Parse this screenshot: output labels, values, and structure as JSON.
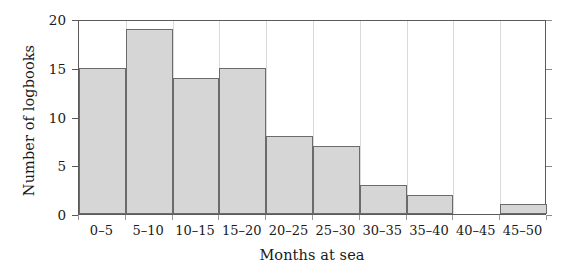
{
  "chart_data": {
    "type": "bar",
    "title": "",
    "subtitle": "",
    "xlabel": "Months at sea",
    "ylabel": "Number of logbooks",
    "categories": [
      "0–5",
      "5–10",
      "10–15",
      "15–20",
      "20–25",
      "25–30",
      "30–35",
      "35–40",
      "40–45",
      "45–50"
    ],
    "values": [
      15,
      19,
      14,
      15,
      8,
      7,
      3,
      2,
      0,
      1
    ],
    "series": [
      {
        "name": "Number of logbooks",
        "values": [
          15,
          19,
          14,
          15,
          8,
          7,
          3,
          2,
          0,
          1
        ]
      }
    ],
    "ylim": [
      0,
      20
    ],
    "yticks": [
      0,
      5,
      10,
      15,
      20
    ],
    "ytick_labels": [
      "0",
      "5",
      "10",
      "15",
      "20"
    ],
    "xlim": [
      0,
      10
    ],
    "grid": "vertical",
    "legend": "none",
    "bar_fill_color": "#d6d6d6",
    "bar_edge_color": "#6b6b6b",
    "axis_color": "#5a5a5a",
    "grid_color": "#d9d9d9",
    "background_color": "#ffffff",
    "annotations": []
  },
  "figure": {
    "ylabel_text": "Number of logbooks",
    "xlabel_text": "Months at sea"
  }
}
